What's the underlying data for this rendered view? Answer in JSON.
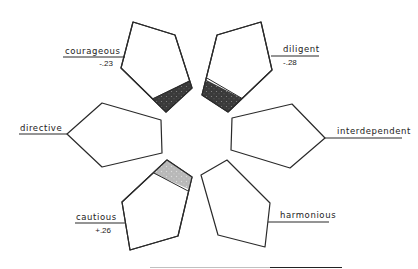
{
  "diagram": {
    "type": "radial-pentagon-profile",
    "petals": [
      {
        "id": "courageous",
        "label": "courageous",
        "value": "-.23",
        "fill": "dark",
        "position": "top-left"
      },
      {
        "id": "diligent",
        "label": "diligent",
        "value": "-.28",
        "fill": "dark",
        "position": "top-right"
      },
      {
        "id": "directive",
        "label": "directive",
        "value": "",
        "fill": "none",
        "position": "left"
      },
      {
        "id": "interdependent",
        "label": "interdependent",
        "value": "",
        "fill": "none",
        "position": "right"
      },
      {
        "id": "cautious",
        "label": "cautious",
        "value": "+.26",
        "fill": "light",
        "position": "bottom-left"
      },
      {
        "id": "harmonious",
        "label": "harmonious",
        "value": "",
        "fill": "none",
        "position": "bottom-right"
      }
    ],
    "colors": {
      "outline": "#2a2a2a",
      "negative_fill": "#3a3a3a",
      "positive_fill": "#b8b8b8",
      "background": "#ffffff"
    }
  },
  "labels": {
    "courageous": "courageous",
    "courageous_value": "-.23",
    "diligent": "diligent",
    "diligent_value": "-.28",
    "directive": "directive",
    "interdependent": "interdependent",
    "cautious": "cautious",
    "cautious_value": "+.26",
    "harmonious": "harmonious"
  }
}
